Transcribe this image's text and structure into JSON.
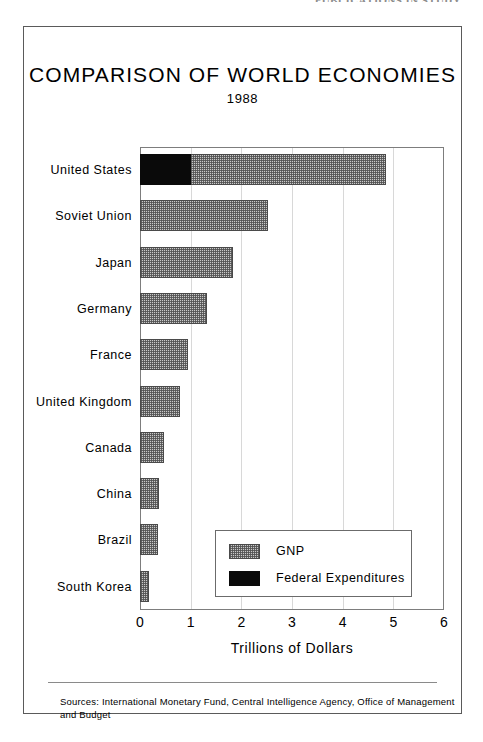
{
  "running_head": "PUBLICATIONS IN STUDY",
  "chart_data": {
    "type": "bar",
    "orientation": "horizontal",
    "title": "COMPARISON OF WORLD ECONOMIES",
    "subtitle": "1988",
    "xlabel": "Trillions of Dollars",
    "ylabel": "",
    "xlim": [
      0,
      6
    ],
    "xticks": [
      "0",
      "1",
      "2",
      "3",
      "4",
      "5",
      "6"
    ],
    "grid": true,
    "legend_position": "inside-bottom-right",
    "categories": [
      "United States",
      "Soviet Union",
      "Japan",
      "Germany",
      "France",
      "United Kingdom",
      "Canada",
      "China",
      "Brazil",
      "South Korea"
    ],
    "series": [
      {
        "name": "GNP",
        "key": "gnp",
        "color": "#c9c9c9",
        "pattern": "hatched",
        "values": [
          4.85,
          2.52,
          1.84,
          1.33,
          0.95,
          0.78,
          0.48,
          0.37,
          0.35,
          0.17
        ]
      },
      {
        "name": "Federal Expenditures",
        "key": "fed",
        "color": "#0a0a0a",
        "pattern": "solid",
        "values": [
          1.0,
          null,
          null,
          null,
          null,
          null,
          null,
          null,
          null,
          null
        ]
      }
    ],
    "legend": [
      {
        "label": "GNP",
        "key": "gnp"
      },
      {
        "label": "Federal Expenditures",
        "key": "fed"
      }
    ]
  },
  "sources": "Sources:  International Monetary Fund, Central Intelligence Agency, Office of Management and Budget"
}
